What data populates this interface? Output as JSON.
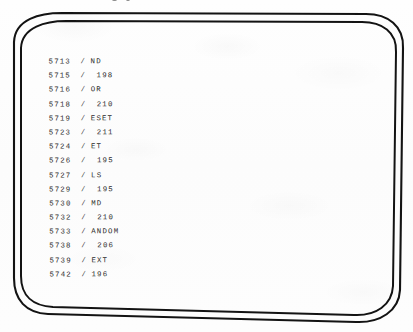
{
  "figure": {
    "kind": "crt-screen-listing",
    "caption_fragment": "",
    "screen": {
      "border_style": "double-line-rounded-rectangle",
      "ink_color": "#111111",
      "screen_fill": "#ffffff"
    }
  },
  "terminal": {
    "text_color": "#2b2b2b",
    "lines": [
      {
        "number": "5713",
        "slash": "/",
        "value": "ND",
        "indented": false
      },
      {
        "number": "5715",
        "slash": "/",
        "value": "198",
        "indented": true
      },
      {
        "number": "5716",
        "slash": "/",
        "value": "OR",
        "indented": false
      },
      {
        "number": "5718",
        "slash": "/",
        "value": "210",
        "indented": true
      },
      {
        "number": "5719",
        "slash": "/",
        "value": "ESET",
        "indented": false
      },
      {
        "number": "5723",
        "slash": "/",
        "value": "211",
        "indented": true
      },
      {
        "number": "5724",
        "slash": "/",
        "value": "ET",
        "indented": false
      },
      {
        "number": "5726",
        "slash": "/",
        "value": "195",
        "indented": true
      },
      {
        "number": "5727",
        "slash": "/",
        "value": "LS",
        "indented": false
      },
      {
        "number": "5729",
        "slash": "/",
        "value": "195",
        "indented": true
      },
      {
        "number": "5730",
        "slash": "/",
        "value": "MD",
        "indented": false
      },
      {
        "number": "5732",
        "slash": "/",
        "value": "210",
        "indented": true
      },
      {
        "number": "5733",
        "slash": "/",
        "value": "ANDOM",
        "indented": false
      },
      {
        "number": "5738",
        "slash": "/",
        "value": "206",
        "indented": true
      },
      {
        "number": "5739",
        "slash": "/",
        "value": "EXT",
        "indented": false
      },
      {
        "number": "5742",
        "slash": "/",
        "value": "196",
        "indented": false
      }
    ]
  }
}
